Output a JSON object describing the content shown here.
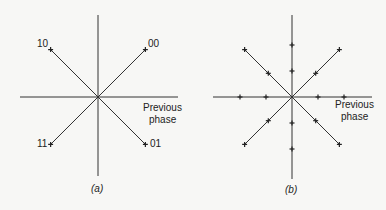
{
  "panels": [
    {
      "id": "a",
      "caption": "(a)",
      "axis_label_line1": "Previous",
      "axis_label_line2": "phase",
      "points": [
        {
          "label": "00",
          "angle_deg": 45
        },
        {
          "label": "10",
          "angle_deg": 135
        },
        {
          "label": "11",
          "angle_deg": 225
        },
        {
          "label": "01",
          "angle_deg": 315
        }
      ]
    },
    {
      "id": "b",
      "caption": "(b)",
      "axis_label_line1": "Previous",
      "axis_label_line2": "phase",
      "marker_angles_deg": [
        0,
        45,
        90,
        135,
        180,
        225,
        270,
        315
      ],
      "marker_radii": [
        0.5,
        1.0
      ]
    }
  ]
}
